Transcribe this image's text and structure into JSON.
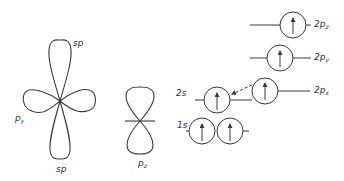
{
  "figure": {
    "type": "orbital-diagram",
    "stroke_color": "#3a3a3a",
    "label_color": "#333333"
  },
  "sp_hybrid": {
    "top_label": "sp",
    "bottom_label": "sp",
    "side_label_main": "p",
    "side_label_sub": "y"
  },
  "pz_orbital": {
    "label_main": "p",
    "label_sub": "z"
  },
  "energy_levels": {
    "levels": [
      {
        "name": "2pz",
        "label_main": "2p",
        "label_sub": "z",
        "electrons": [
          "up"
        ]
      },
      {
        "name": "2py",
        "label_main": "2p",
        "label_sub": "y",
        "electrons": [
          "up"
        ]
      },
      {
        "name": "2px",
        "label_main": "2p",
        "label_sub": "x",
        "electrons": [
          "up"
        ]
      },
      {
        "name": "2s",
        "label_main": "2s",
        "label_sub": "",
        "electrons": [
          "up"
        ]
      },
      {
        "name": "1s",
        "label_main": "1s",
        "label_sub": "",
        "electrons": [
          "up",
          "up"
        ]
      }
    ],
    "promotion_arrow": "2s-to-2px"
  }
}
